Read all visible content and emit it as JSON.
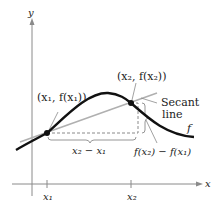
{
  "figure": {
    "axis_labels": {
      "x": "x",
      "y": "y"
    },
    "point1_label": "(x₁, f(x₁))",
    "point2_label": "(x₂, f(x₂))",
    "secant_label_line1": "Secant",
    "secant_label_line2": "line",
    "curve_label": "f",
    "dx_label": "x₂ − x₁",
    "dy_label": "f(x₂) − f(x₁)",
    "tick_x1": "x₁",
    "tick_x2": "x₂",
    "colors": {
      "curve": "#111111",
      "secant": "#b0b0b0",
      "axes": "#8a8a8a",
      "dashed": "#8a8a8a",
      "text": "#222222"
    }
  }
}
